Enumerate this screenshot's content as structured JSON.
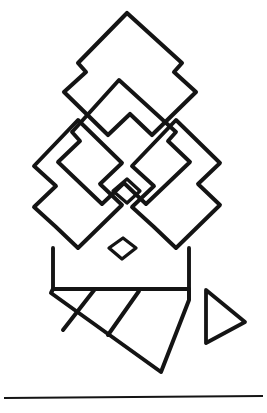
{
  "figure": {
    "background_color": "#ffffff",
    "ink_color": "#141414",
    "canvas": {
      "width": 267,
      "height": 413
    },
    "parts": [
      {
        "name": "outer-chevron-outline",
        "label": "Outer stepped chevron"
      },
      {
        "name": "inner-chevron-outline",
        "label": "Inner stepped chevron"
      },
      {
        "name": "left-zigzag-diamond",
        "label": "Left zigzag diamond"
      },
      {
        "name": "right-zigzag-diamond",
        "label": "Right zigzag diamond"
      },
      {
        "name": "upper-small-diamond",
        "label": "Upper small diamond"
      },
      {
        "name": "lower-small-diamond",
        "label": "Lower small diamond"
      },
      {
        "name": "parallelogram-band",
        "label": "Slanted banded strip"
      },
      {
        "name": "band-divider-one",
        "label": "First band divider"
      },
      {
        "name": "band-divider-two",
        "label": "Second band divider"
      },
      {
        "name": "right-triangle",
        "label": "Right-pointing triangle"
      },
      {
        "name": "baseline-rule",
        "label": "Horizontal baseline rule"
      }
    ],
    "geometry": {
      "outer_chevron": "M 127 13 L 182 63 L 174 72 L 196 92 L 152 135 L 130 114 L 108 135 L 64 92 L 86 72 L 78 63 Z",
      "inner_chevron": "M 119 80 L 176 132 L 168 141 L 190 162 L 146 204 L 124 183 L 102 204 L 58 162 L 80 141 L 72 132 Z",
      "left_zigzag": "M 78 120 L 122 163 L 100 184 L 122 205 L 78 248 L 56 227 L 34 207 L 56 186 L 34 166 Z",
      "right_zigzag": "M 176 120 L 220 163 L 198 184 L 220 205 L 176 248 L 154 227 L 132 207 L 154 186 L 132 166 Z",
      "upper_small_diamond": "M 127 179 L 140 191 L 127 203 L 113 191 Z",
      "lower_small_diamond": "M 123 238 L 136 248 L 122 259 L 109 248 Z",
      "band_outline": "M 53 289 L 189 289 L 189 300 L 161 372 L 51 293 Z",
      "band_divider_one": "M 95 289 L 63 330",
      "band_divider_two": "M 139 291 L 108 335",
      "right_triangle": "M 206 290 L 245 322 L 206 343 Z",
      "baseline_rule": "M 4 398 L 263 396",
      "left_riser": "M 53 248 L 53 289",
      "right_riser": "M 189 248 L 189 289"
    }
  }
}
